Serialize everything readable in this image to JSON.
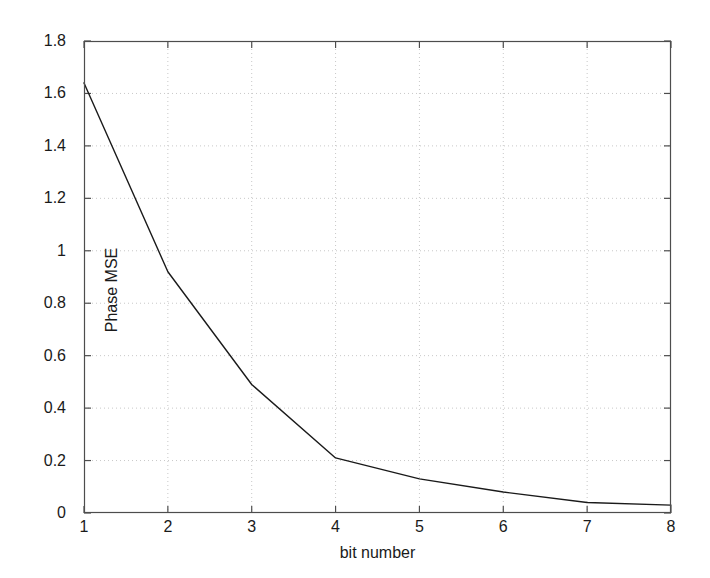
{
  "figure": {
    "background_color": "#ffffff",
    "axes_color": "#4d4d4d",
    "grid_color": "#c8c8c8",
    "line_color": "#1a1a1a"
  },
  "chart_data": {
    "type": "line",
    "title": "",
    "subtitle": "",
    "xlabel": "bit number",
    "ylabel": "Phase MSE",
    "x": [
      1,
      2,
      3,
      4,
      5,
      6,
      7,
      8
    ],
    "values": [
      1.64,
      0.92,
      0.49,
      0.21,
      0.13,
      0.08,
      0.04,
      0.03
    ],
    "series": [
      {
        "name": "Phase MSE",
        "values": [
          1.64,
          0.92,
          0.49,
          0.21,
          0.13,
          0.08,
          0.04,
          0.03
        ]
      }
    ],
    "xlim": [
      1,
      8
    ],
    "ylim": [
      0,
      1.8
    ],
    "xticks": [
      1,
      2,
      3,
      4,
      5,
      6,
      7,
      8
    ],
    "xtick_labels": [
      "1",
      "2",
      "3",
      "4",
      "5",
      "6",
      "7",
      "8"
    ],
    "yticks": [
      0,
      0.2,
      0.4,
      0.6,
      0.8,
      1.0,
      1.2,
      1.4,
      1.6,
      1.8
    ],
    "ytick_labels": [
      "0",
      "0.2",
      "0.4",
      "0.6",
      "0.8",
      "1",
      "1.2",
      "1.4",
      "1.6",
      "1.8"
    ],
    "grid": true,
    "grid_style": "dotted",
    "legend": null,
    "legend_position": "none",
    "annotations": []
  }
}
